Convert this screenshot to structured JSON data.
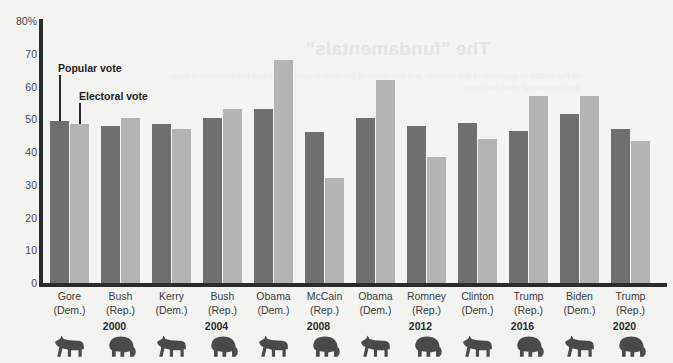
{
  "chart_data": {
    "type": "bar",
    "title": "",
    "xlabel": "",
    "ylabel": "",
    "ylim": [
      0,
      80
    ],
    "ytick_labels": [
      "80%",
      "70",
      "60",
      "50",
      "40",
      "30",
      "20",
      "10",
      "0"
    ],
    "ytick_values": [
      80,
      70,
      60,
      50,
      40,
      30,
      20,
      10,
      0
    ],
    "grid": false,
    "legend_position": "inside-top-left",
    "categories": [
      "Gore (Dem.)",
      "Bush (Rep.)",
      "Kerry (Dem.)",
      "Bush (Rep.)",
      "Obama (Dem.)",
      "McCain (Rep.)",
      "Obama (Dem.)",
      "Romney (Rep.)",
      "Clinton (Dem.)",
      "Trump (Rep.)",
      "Biden (Dem.)",
      "Trump (Rep.)"
    ],
    "series": [
      {
        "name": "Popular vote",
        "color": "#6f6f6f",
        "values": [
          49.5,
          48,
          48.5,
          50.5,
          53,
          46,
          50.5,
          48,
          49,
          46.5,
          51.5,
          47
        ]
      },
      {
        "name": "Electoral vote",
        "color": "#b4b4b4",
        "values": [
          48.5,
          50.5,
          47,
          53,
          68,
          32,
          62,
          38.5,
          44,
          57,
          57,
          43.5
        ]
      }
    ]
  },
  "candidates": [
    {
      "name": "Gore",
      "party": "(Dem.)",
      "mascot": "donkey-icon",
      "popular": 49.5,
      "electoral": 48.5
    },
    {
      "name": "Bush",
      "party": "(Rep.)",
      "mascot": "elephant-icon",
      "popular": 48,
      "electoral": 50.5
    },
    {
      "name": "Kerry",
      "party": "(Dem.)",
      "mascot": "donkey-icon",
      "popular": 48.5,
      "electoral": 47
    },
    {
      "name": "Bush",
      "party": "(Rep.)",
      "mascot": "elephant-icon",
      "popular": 50.5,
      "electoral": 53
    },
    {
      "name": "Obama",
      "party": "(Dem.)",
      "mascot": "donkey-icon",
      "popular": 53,
      "electoral": 68
    },
    {
      "name": "McCain",
      "party": "(Rep.)",
      "mascot": "elephant-icon",
      "popular": 46,
      "electoral": 32
    },
    {
      "name": "Obama",
      "party": "(Dem.)",
      "mascot": "donkey-icon",
      "popular": 50.5,
      "electoral": 62
    },
    {
      "name": "Romney",
      "party": "(Rep.)",
      "mascot": "elephant-icon",
      "popular": 48,
      "electoral": 38.5
    },
    {
      "name": "Clinton",
      "party": "(Dem.)",
      "mascot": "donkey-icon",
      "popular": 49,
      "electoral": 44
    },
    {
      "name": "Trump",
      "party": "(Rep.)",
      "mascot": "elephant-icon",
      "popular": 46.5,
      "electoral": 57
    },
    {
      "name": "Biden",
      "party": "(Dem.)",
      "mascot": "donkey-icon",
      "popular": 51.5,
      "electoral": 57
    },
    {
      "name": "Trump",
      "party": "(Rep.)",
      "mascot": "elephant-icon",
      "popular": 47,
      "electoral": 43.5
    }
  ],
  "years": [
    "2000",
    "2004",
    "2008",
    "2012",
    "2016",
    "2020"
  ],
  "annotations": {
    "popular_vote_label": "Popular vote",
    "electoral_vote_label": "Electoral vote"
  },
  "bleed_through": {
    "title": "The \"fundamentals\"",
    "body": "of the matter in question of the election and the result of the vote in each state and the electoral college totals reported after the count"
  }
}
